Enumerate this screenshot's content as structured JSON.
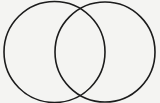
{
  "canvas": {
    "width": 160,
    "height": 103,
    "background_color": "#f4f4f2",
    "title": "Venn Diagram"
  },
  "chart_data": {
    "type": "diagram",
    "subtype": "venn",
    "title": "",
    "subtitle": "",
    "xlabel": "",
    "ylabel": "",
    "grid": false,
    "legend": false,
    "annotations": [],
    "style": {
      "stroke_color": "#1c1c1c",
      "stroke_width": 1.6,
      "fill": "none",
      "background_color": "#f4f4f2"
    },
    "sets": [
      {
        "name": "left-set",
        "label": "",
        "cx": 54.5,
        "cy": 52,
        "r": 50.5,
        "fill": "none",
        "stroke": "#1c1c1c"
      },
      {
        "name": "right-set",
        "label": "",
        "cx": 105,
        "cy": 52,
        "r": 50,
        "fill": "none",
        "stroke": "#1c1c1c"
      }
    ],
    "intersection_points": [
      {
        "x": 80,
        "y": 9.5
      },
      {
        "x": 80,
        "y": 94.5
      }
    ],
    "region_labels": []
  }
}
